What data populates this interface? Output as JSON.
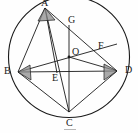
{
  "figure": {
    "kind": "circle-geometry-diagram",
    "width": 138,
    "height": 133,
    "background_color": "#fefefe",
    "stroke_color": "#1a1a1a",
    "angle_marker_fill": "#8c8c8c"
  },
  "circle": {
    "name": "circumscribed-circle",
    "center_x": 69,
    "center_y": 57,
    "radius": 60.5
  },
  "points": [
    {
      "id": "A",
      "label": "A",
      "x": 45,
      "y": 8,
      "label_x": 41,
      "label_y": -2,
      "on_circle": true
    },
    {
      "id": "B",
      "label": "B",
      "x": 18,
      "y": 72,
      "label_x": 4,
      "label_y": 66,
      "on_circle": true
    },
    {
      "id": "C",
      "label": "C",
      "x": 69,
      "y": 112,
      "label_x": 66,
      "label_y": 118,
      "on_circle": true
    },
    {
      "id": "D",
      "label": "D",
      "x": 117,
      "y": 71,
      "label_x": 125,
      "label_y": 65,
      "on_circle": true
    },
    {
      "id": "O",
      "label": "O",
      "x": 69,
      "y": 57,
      "label_x": 72,
      "label_y": 47,
      "on_circle": false
    },
    {
      "id": "E",
      "label": "E",
      "x": 57,
      "y": 73,
      "label_x": 52,
      "label_y": 73,
      "on_circle": false
    },
    {
      "id": "F",
      "label": "F",
      "x": 93,
      "y": 54,
      "label_x": 98,
      "label_y": 41,
      "on_circle": false
    },
    {
      "id": "G",
      "label": "G",
      "x": 69,
      "y": 36,
      "label_x": 68,
      "label_y": 15,
      "on_circle": false
    }
  ],
  "segments": [
    {
      "name": "segment-AB",
      "from": "A",
      "to": "B"
    },
    {
      "name": "segment-AC",
      "from": "A",
      "to": "C"
    },
    {
      "name": "segment-AD",
      "from": "A",
      "to": "D"
    },
    {
      "name": "segment-AE",
      "from": "A",
      "to": "E"
    },
    {
      "name": "segment-BC",
      "from": "B",
      "to": "C"
    },
    {
      "name": "segment-BD",
      "from": "B",
      "to": "D"
    },
    {
      "name": "segment-BF",
      "from": "B",
      "to": "F"
    },
    {
      "name": "segment-CD",
      "from": "C",
      "to": "D"
    },
    {
      "name": "segment-CG",
      "from": "C",
      "to": "G"
    },
    {
      "name": "segment-OD",
      "from": "O",
      "to": "D"
    }
  ],
  "angle_markers": [
    {
      "name": "angle-marker-A",
      "at": "A"
    },
    {
      "name": "angle-marker-B",
      "at": "B"
    },
    {
      "name": "angle-marker-D",
      "at": "D"
    }
  ],
  "artifacts": [
    {
      "name": "scan-artifact-underline",
      "x": 64,
      "y": 129,
      "width": 12,
      "height": 1
    }
  ]
}
